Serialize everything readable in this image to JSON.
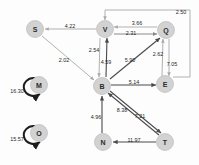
{
  "diagram": {
    "colors": {
      "node_fill": "#d2d2d2",
      "node_stroke": "#b4b4b4",
      "edge_light": "#a8a8a8",
      "edge_dark": "#4a4a4a",
      "loop_stroke": "#1d1d1d",
      "label_text": "#1f1f1f",
      "background": "#fdfdfd"
    },
    "nodes": [
      {
        "id": "S",
        "label": "S",
        "x": 35,
        "y": 29,
        "r": 8.5
      },
      {
        "id": "V",
        "label": "V",
        "x": 105,
        "y": 29,
        "r": 8.5
      },
      {
        "id": "Q",
        "label": "Q",
        "x": 166,
        "y": 30,
        "r": 8.5
      },
      {
        "id": "B",
        "label": "B",
        "x": 102,
        "y": 86,
        "r": 8.5
      },
      {
        "id": "E",
        "label": "E",
        "x": 165,
        "y": 84,
        "r": 8.5
      },
      {
        "id": "N",
        "label": "N",
        "x": 103,
        "y": 142,
        "r": 8.5
      },
      {
        "id": "T",
        "label": "T",
        "x": 165,
        "y": 142,
        "r": 8.5
      },
      {
        "id": "M",
        "label": "M",
        "x": 39,
        "y": 85,
        "r": 8.5
      },
      {
        "id": "O",
        "label": "O",
        "x": 39,
        "y": 133,
        "r": 8.5
      }
    ],
    "edges": [
      {
        "from": "V",
        "to": "S",
        "weight": "4.22",
        "lx": 70,
        "ly": 26,
        "style": "light"
      },
      {
        "from": "Q",
        "to": "V",
        "weight": "3.66",
        "lx": 137,
        "ly": 23,
        "style": "light"
      },
      {
        "from": "V",
        "to": "Q",
        "weight": "2.31",
        "lx": 131,
        "ly": 33,
        "style": "mid"
      },
      {
        "from": "E",
        "to": "V",
        "weight": "2.50",
        "lx": 181,
        "ly": 12,
        "style": "light"
      },
      {
        "from": "V",
        "to": "B",
        "weight": "2.54",
        "lx": 94,
        "ly": 50,
        "style": "light"
      },
      {
        "from": "B",
        "to": "V",
        "weight": "4.59",
        "lx": 106,
        "ly": 62,
        "style": "dark"
      },
      {
        "from": "B",
        "to": "Q",
        "weight": "5.90",
        "lx": 130,
        "ly": 60,
        "style": "dark"
      },
      {
        "from": "S",
        "to": "B",
        "weight": "2.02",
        "lx": 64,
        "ly": 60,
        "style": "light"
      },
      {
        "from": "E",
        "to": "Q",
        "weight": "2.62",
        "lx": 158,
        "ly": 54,
        "style": "light"
      },
      {
        "from": "Q",
        "to": "E",
        "weight": "7.05",
        "lx": 172,
        "ly": 64,
        "style": "light"
      },
      {
        "from": "B",
        "to": "E",
        "weight": "5.14",
        "lx": 134,
        "ly": 82,
        "style": "dark"
      },
      {
        "from": "N",
        "to": "B",
        "weight": "4.96",
        "lx": 96,
        "ly": 117,
        "style": "dark"
      },
      {
        "from": "T",
        "to": "B",
        "weight": "8.38",
        "lx": 122,
        "ly": 110,
        "style": "dark"
      },
      {
        "from": "B",
        "to": "T",
        "weight": "7.21",
        "lx": 140,
        "ly": 116,
        "style": "dark"
      },
      {
        "from": "T",
        "to": "N",
        "weight": "11.97",
        "lx": 134,
        "ly": 140,
        "style": "dark"
      }
    ],
    "self_loops": [
      {
        "node": "M",
        "weight": "16.30",
        "lx": 17,
        "ly": 91
      },
      {
        "node": "O",
        "weight": "15.57",
        "lx": 17,
        "ly": 139
      }
    ]
  }
}
